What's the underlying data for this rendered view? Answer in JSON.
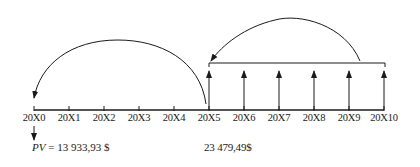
{
  "timeline": {
    "labels": [
      "20X0",
      "20X1",
      "20X2",
      "20X3",
      "20X4",
      "20X5",
      "20X6",
      "20X7",
      "20X8",
      "20X9",
      "20X10"
    ],
    "annuity_periods": [
      "20X5",
      "20X6",
      "20X7",
      "20X8",
      "20X9",
      "20X10"
    ]
  },
  "values": {
    "pv_symbol": "PV",
    "pv_equals": " = 13 933,93 $",
    "intermediate_value": "23 479,49$"
  },
  "colors": {
    "line": "#1a1a1a",
    "background": "#ffffff"
  }
}
